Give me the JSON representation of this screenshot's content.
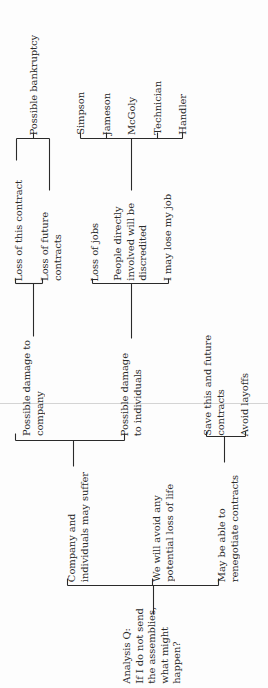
{
  "diagram": {
    "type": "tree",
    "orientation": "rotated-90-ccw",
    "root": {
      "id": "root",
      "lines": [
        "Analysis Q:",
        "If I do not send",
        "the assemblies,",
        "what might",
        "happen?"
      ],
      "x": 121,
      "y_bottom": 684
    },
    "nodes": [
      {
        "id": "company-and-individuals",
        "lines": [
          "Company and",
          "individuals may suffer"
        ],
        "x": 66,
        "y_bottom": 582
      },
      {
        "id": "avoid-loss-of-life",
        "lines": [
          "We will avoid any",
          "potential loss of life"
        ],
        "x": 151,
        "y_bottom": 582
      },
      {
        "id": "renegotiate-contracts",
        "lines": [
          "May be able to",
          "renegotiate contracts"
        ],
        "x": 216,
        "y_bottom": 582
      },
      {
        "id": "damage-to-company",
        "lines": [
          "Possible damage to",
          "company"
        ],
        "x": 21,
        "y_bottom": 436
      },
      {
        "id": "damage-to-individuals",
        "lines": [
          "Possible damage",
          "to individuals"
        ],
        "x": 119,
        "y_bottom": 436
      },
      {
        "id": "save-contracts",
        "lines": [
          "Save this and future",
          "contracts"
        ],
        "x": 202,
        "y_bottom": 436
      },
      {
        "id": "avoid-layoffs",
        "lines": [
          "Avoid layoffs"
        ],
        "x": 239,
        "y_bottom": 436
      },
      {
        "id": "loss-this-contract",
        "lines": [
          "Loss of this contract"
        ],
        "x": 13,
        "y_bottom": 281
      },
      {
        "id": "loss-future-contracts",
        "lines": [
          "Loss of future",
          "contracts"
        ],
        "x": 39,
        "y_bottom": 281
      },
      {
        "id": "loss-of-jobs",
        "lines": [
          "Loss of jobs"
        ],
        "x": 89,
        "y_bottom": 281
      },
      {
        "id": "people-discredited",
        "lines": [
          "People directly",
          "involved will be",
          "discredited"
        ],
        "x": 112,
        "y_bottom": 281
      },
      {
        "id": "lose-my-job",
        "lines": [
          "I may lose my job"
        ],
        "x": 162,
        "y_bottom": 281
      },
      {
        "id": "possible-bankruptcy",
        "lines": [
          "Possible bankruptcy"
        ],
        "x": 28,
        "y_bottom": 135
      },
      {
        "id": "simpson",
        "lines": [
          "Simpson"
        ],
        "x": 75,
        "y_bottom": 135
      },
      {
        "id": "jameson",
        "lines": [
          "Jameson"
        ],
        "x": 101,
        "y_bottom": 135
      },
      {
        "id": "mcgoly",
        "lines": [
          "McGoly"
        ],
        "x": 126,
        "y_bottom": 135
      },
      {
        "id": "technician",
        "lines": [
          "Technician"
        ],
        "x": 152,
        "y_bottom": 135
      },
      {
        "id": "handler",
        "lines": [
          "Handler"
        ],
        "x": 177,
        "y_bottom": 135
      }
    ],
    "edges": [
      {
        "from": "root",
        "to": [
          "company-and-individuals",
          "avoid-loss-of-life",
          "renegotiate-contracts"
        ]
      },
      {
        "from": "company-and-individuals",
        "to": [
          "damage-to-company",
          "damage-to-individuals"
        ]
      },
      {
        "from": "renegotiate-contracts",
        "to": [
          "save-contracts",
          "avoid-layoffs"
        ]
      },
      {
        "from": "damage-to-company",
        "to": [
          "loss-this-contract",
          "loss-future-contracts"
        ]
      },
      {
        "from": "damage-to-individuals",
        "to": [
          "loss-of-jobs",
          "people-discredited",
          "lose-my-job"
        ]
      },
      {
        "from": "loss-this-contract",
        "to": [
          "possible-bankruptcy"
        ]
      },
      {
        "from": "loss-future-contracts",
        "to": [
          "possible-bankruptcy"
        ]
      },
      {
        "from": "people-discredited",
        "to": [
          "simpson",
          "jameson",
          "mcgoly",
          "technician",
          "handler"
        ]
      }
    ],
    "lines_px": [
      [
        153,
        585,
        153,
        614
      ],
      [
        67,
        585,
        218,
        585
      ],
      [
        67,
        585,
        67,
        578
      ],
      [
        152,
        585,
        152,
        578
      ],
      [
        218,
        585,
        218,
        578
      ],
      [
        73,
        466,
        73,
        440
      ],
      [
        15,
        440,
        124,
        440
      ],
      [
        15,
        440,
        15,
        433
      ],
      [
        124,
        440,
        124,
        433
      ],
      [
        224,
        462,
        224,
        436
      ],
      [
        206,
        436,
        245,
        436
      ],
      [
        206,
        436,
        206,
        431
      ],
      [
        245,
        436,
        245,
        431
      ],
      [
        33,
        336,
        33,
        283
      ],
      [
        15,
        283,
        42,
        283
      ],
      [
        15,
        283,
        15,
        278
      ],
      [
        42,
        283,
        42,
        278
      ],
      [
        131,
        338,
        131,
        283
      ],
      [
        92,
        283,
        168,
        283
      ],
      [
        92,
        283,
        92,
        278
      ],
      [
        168,
        283,
        168,
        278
      ],
      [
        16,
        160,
        16,
        138
      ],
      [
        49,
        190,
        49,
        138
      ],
      [
        16,
        138,
        49,
        138
      ],
      [
        33,
        138,
        33,
        132
      ],
      [
        131,
        190,
        131,
        138
      ],
      [
        80,
        138,
        182,
        138
      ],
      [
        80,
        138,
        80,
        132
      ],
      [
        106,
        138,
        106,
        132
      ],
      [
        157,
        138,
        157,
        132
      ],
      [
        182,
        138,
        182,
        132
      ]
    ],
    "colors": {
      "ink": "#2a2a2a",
      "paper": "#fdfdfd",
      "fold": "#d4d4d4"
    }
  }
}
